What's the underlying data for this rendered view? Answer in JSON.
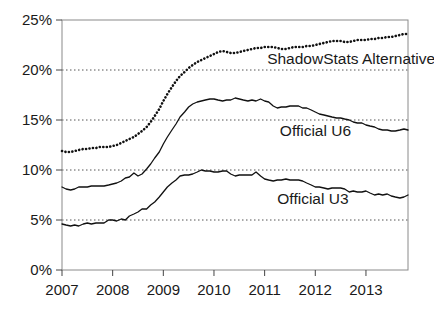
{
  "chart_data": {
    "type": "line",
    "title": "",
    "subtitle": "",
    "xlabel": "",
    "ylabel": "",
    "xlim": [
      2007.0,
      2013.83
    ],
    "ylim": [
      0,
      25
    ],
    "y_tick_labels": [
      "0%",
      "5%",
      "10%",
      "15%",
      "20%",
      "25%"
    ],
    "y_tick_values": [
      0,
      5,
      10,
      15,
      20,
      25
    ],
    "x_tick_labels": [
      "2007",
      "2008",
      "2009",
      "2010",
      "2011",
      "2012",
      "2013"
    ],
    "x_tick_values": [
      2007,
      2008,
      2009,
      2010,
      2011,
      2012,
      2013
    ],
    "grid": "horizontal-dotted",
    "legend_position": "inline-annotations",
    "units": "percent",
    "series": [
      {
        "name": "ShadowStats Alternative",
        "style": "dotted",
        "color": "#111111",
        "label_x": 2011.05,
        "label_y": 20.6,
        "x": [
          2007.0,
          2007.08,
          2007.17,
          2007.25,
          2007.33,
          2007.42,
          2007.5,
          2007.58,
          2007.67,
          2007.75,
          2007.83,
          2007.92,
          2008.0,
          2008.08,
          2008.17,
          2008.25,
          2008.33,
          2008.42,
          2008.5,
          2008.58,
          2008.67,
          2008.75,
          2008.83,
          2008.92,
          2009.0,
          2009.08,
          2009.17,
          2009.25,
          2009.33,
          2009.42,
          2009.5,
          2009.58,
          2009.67,
          2009.75,
          2009.83,
          2009.92,
          2010.0,
          2010.08,
          2010.17,
          2010.25,
          2010.33,
          2010.42,
          2010.5,
          2010.58,
          2010.67,
          2010.75,
          2010.83,
          2010.92,
          2011.0,
          2011.08,
          2011.17,
          2011.25,
          2011.33,
          2011.42,
          2011.5,
          2011.58,
          2011.67,
          2011.75,
          2011.83,
          2011.92,
          2012.0,
          2012.08,
          2012.17,
          2012.25,
          2012.33,
          2012.42,
          2012.5,
          2012.58,
          2012.67,
          2012.75,
          2012.83,
          2012.92,
          2013.0,
          2013.08,
          2013.17,
          2013.25,
          2013.33,
          2013.42,
          2013.5,
          2013.58,
          2013.67,
          2013.75,
          2013.83
        ],
        "y": [
          11.9,
          11.8,
          11.8,
          11.9,
          12.0,
          12.1,
          12.1,
          12.2,
          12.2,
          12.3,
          12.3,
          12.3,
          12.4,
          12.5,
          12.7,
          12.9,
          13.1,
          13.3,
          13.6,
          13.9,
          14.3,
          14.8,
          15.4,
          16.1,
          16.9,
          17.6,
          18.3,
          18.9,
          19.4,
          19.8,
          20.2,
          20.5,
          20.8,
          21.0,
          21.2,
          21.4,
          21.6,
          21.8,
          21.9,
          21.8,
          21.7,
          21.7,
          21.8,
          21.9,
          22.0,
          22.1,
          22.2,
          22.2,
          22.3,
          22.3,
          22.3,
          22.2,
          22.1,
          22.1,
          22.2,
          22.3,
          22.3,
          22.3,
          22.4,
          22.4,
          22.5,
          22.6,
          22.7,
          22.8,
          22.9,
          22.9,
          22.9,
          22.8,
          22.8,
          22.9,
          23.0,
          23.0,
          23.0,
          23.1,
          23.1,
          23.2,
          23.2,
          23.3,
          23.3,
          23.4,
          23.5,
          23.6,
          23.6
        ]
      },
      {
        "name": "Official U6",
        "style": "solid",
        "color": "#111111",
        "label_x": 2011.3,
        "label_y": 13.4,
        "x": [
          2007.0,
          2007.08,
          2007.17,
          2007.25,
          2007.33,
          2007.42,
          2007.5,
          2007.58,
          2007.67,
          2007.75,
          2007.83,
          2007.92,
          2008.0,
          2008.08,
          2008.17,
          2008.25,
          2008.33,
          2008.42,
          2008.5,
          2008.58,
          2008.67,
          2008.75,
          2008.83,
          2008.92,
          2009.0,
          2009.08,
          2009.17,
          2009.25,
          2009.33,
          2009.42,
          2009.5,
          2009.58,
          2009.67,
          2009.75,
          2009.83,
          2009.92,
          2010.0,
          2010.08,
          2010.17,
          2010.25,
          2010.33,
          2010.42,
          2010.5,
          2010.58,
          2010.67,
          2010.75,
          2010.83,
          2010.92,
          2011.0,
          2011.08,
          2011.17,
          2011.25,
          2011.33,
          2011.42,
          2011.5,
          2011.58,
          2011.67,
          2011.75,
          2011.83,
          2011.92,
          2012.0,
          2012.08,
          2012.17,
          2012.25,
          2012.33,
          2012.42,
          2012.5,
          2012.58,
          2012.67,
          2012.75,
          2012.83,
          2012.92,
          2013.0,
          2013.08,
          2013.17,
          2013.25,
          2013.33,
          2013.42,
          2013.5,
          2013.58,
          2013.67,
          2013.75,
          2013.83
        ],
        "y": [
          8.3,
          8.1,
          8.0,
          8.1,
          8.3,
          8.3,
          8.3,
          8.4,
          8.4,
          8.4,
          8.4,
          8.5,
          8.6,
          8.7,
          8.9,
          9.2,
          9.3,
          9.7,
          9.4,
          9.6,
          10.1,
          10.6,
          11.2,
          11.8,
          12.6,
          13.3,
          14.0,
          14.6,
          15.3,
          15.8,
          16.3,
          16.6,
          16.8,
          16.9,
          17.0,
          17.1,
          17.1,
          17.0,
          16.9,
          17.0,
          17.0,
          17.2,
          17.1,
          17.0,
          16.9,
          17.0,
          16.9,
          17.1,
          16.9,
          16.8,
          16.4,
          16.2,
          16.3,
          16.3,
          16.4,
          16.4,
          16.4,
          16.2,
          16.2,
          16.0,
          15.8,
          15.6,
          15.5,
          15.4,
          15.3,
          15.2,
          15.2,
          15.1,
          15.0,
          14.8,
          14.7,
          14.7,
          14.5,
          14.4,
          14.3,
          14.1,
          14.0,
          14.0,
          13.9,
          13.9,
          14.0,
          14.1,
          14.0
        ]
      },
      {
        "name": "Official U3",
        "style": "solid",
        "color": "#111111",
        "label_x": 2011.25,
        "label_y": 6.65,
        "x": [
          2007.0,
          2007.08,
          2007.17,
          2007.25,
          2007.33,
          2007.42,
          2007.5,
          2007.58,
          2007.67,
          2007.75,
          2007.83,
          2007.92,
          2008.0,
          2008.08,
          2008.17,
          2008.25,
          2008.33,
          2008.42,
          2008.5,
          2008.58,
          2008.67,
          2008.75,
          2008.83,
          2008.92,
          2009.0,
          2009.08,
          2009.17,
          2009.25,
          2009.33,
          2009.42,
          2009.5,
          2009.58,
          2009.67,
          2009.75,
          2009.83,
          2009.92,
          2010.0,
          2010.08,
          2010.17,
          2010.25,
          2010.33,
          2010.42,
          2010.5,
          2010.58,
          2010.67,
          2010.75,
          2010.83,
          2010.92,
          2011.0,
          2011.08,
          2011.17,
          2011.25,
          2011.33,
          2011.42,
          2011.5,
          2011.58,
          2011.67,
          2011.75,
          2011.83,
          2011.92,
          2012.0,
          2012.08,
          2012.17,
          2012.25,
          2012.33,
          2012.42,
          2012.5,
          2012.58,
          2012.67,
          2012.75,
          2012.83,
          2012.92,
          2013.0,
          2013.08,
          2013.17,
          2013.25,
          2013.33,
          2013.42,
          2013.5,
          2013.58,
          2013.67,
          2013.75,
          2013.83
        ],
        "y": [
          4.6,
          4.5,
          4.4,
          4.5,
          4.4,
          4.6,
          4.7,
          4.6,
          4.7,
          4.7,
          4.7,
          5.0,
          5.0,
          4.9,
          5.1,
          5.0,
          5.4,
          5.6,
          5.8,
          6.1,
          6.1,
          6.5,
          6.8,
          7.3,
          7.8,
          8.3,
          8.7,
          9.0,
          9.4,
          9.5,
          9.5,
          9.6,
          9.8,
          10.0,
          9.9,
          9.9,
          9.8,
          9.8,
          9.9,
          9.9,
          9.6,
          9.4,
          9.5,
          9.5,
          9.5,
          9.5,
          9.8,
          9.4,
          9.1,
          9.0,
          8.9,
          9.0,
          9.0,
          9.1,
          9.0,
          9.0,
          9.0,
          8.9,
          8.7,
          8.5,
          8.3,
          8.3,
          8.2,
          8.1,
          8.2,
          8.2,
          8.2,
          8.1,
          7.8,
          7.9,
          7.8,
          7.8,
          7.9,
          7.7,
          7.5,
          7.6,
          7.5,
          7.6,
          7.4,
          7.3,
          7.2,
          7.3,
          7.5
        ]
      }
    ]
  }
}
